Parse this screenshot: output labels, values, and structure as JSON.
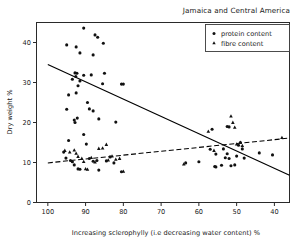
{
  "chart_data": {
    "type": "scatter",
    "title": "Jamaica and Central America",
    "xlabel": "Increasing sclerophylly (i.e decreasing water content) %",
    "ylabel": "Dry weight  %",
    "xlim": [
      103,
      36
    ],
    "ylim": [
      0,
      45
    ],
    "x_ticks": [
      100,
      90,
      80,
      70,
      60,
      50,
      40
    ],
    "y_ticks": [
      0,
      10,
      20,
      30,
      40
    ],
    "x_axis_direction": "decreasing",
    "grid": false,
    "legend_position": "top-right",
    "legend": [
      {
        "name": "protein content",
        "marker": "dot"
      },
      {
        "name": "fibre content",
        "marker": "triangle"
      }
    ],
    "series": [
      {
        "name": "protein content",
        "marker": "dot",
        "trendline": {
          "style": "solid",
          "x1": 100,
          "y1": 34.5,
          "x2": 36,
          "y2": 6.8
        },
        "points": [
          [
            95,
            39.4
          ],
          [
            92.5,
            38.9
          ],
          [
            91.5,
            37.4
          ],
          [
            90.5,
            43.6
          ],
          [
            87.5,
            41.9
          ],
          [
            86.8,
            41.3
          ],
          [
            85.3,
            39.8
          ],
          [
            88.0,
            36.9
          ],
          [
            94.5,
            26.9
          ],
          [
            95.0,
            23.3
          ],
          [
            92.8,
            32.4
          ],
          [
            92.3,
            32.3
          ],
          [
            92.6,
            31.5
          ],
          [
            93.5,
            30.8
          ],
          [
            91.5,
            30.4
          ],
          [
            92.0,
            29.2
          ],
          [
            92.5,
            27.4
          ],
          [
            90.5,
            31.8
          ],
          [
            88.5,
            31.9
          ],
          [
            85.0,
            32.3
          ],
          [
            85.5,
            29.7
          ],
          [
            80.5,
            29.6
          ],
          [
            80.0,
            29.6
          ],
          [
            93.0,
            20.6
          ],
          [
            92.8,
            20.0
          ],
          [
            92.2,
            21.1
          ],
          [
            89.5,
            25.0
          ],
          [
            89.0,
            23.4
          ],
          [
            88.0,
            22.9
          ],
          [
            86.5,
            20.9
          ],
          [
            82.0,
            20.1
          ],
          [
            94.5,
            15.5
          ],
          [
            90.5,
            17.0
          ],
          [
            89.8,
            14.6
          ],
          [
            95.8,
            12.6
          ],
          [
            95.2,
            11.1
          ],
          [
            94.0,
            10.5
          ],
          [
            93.5,
            10.2
          ],
          [
            93.0,
            9.4
          ],
          [
            92.0,
            8.4
          ],
          [
            91.5,
            8.3
          ],
          [
            89.0,
            11.0
          ],
          [
            88.0,
            10.3
          ],
          [
            87.0,
            10.5
          ],
          [
            86.5,
            8.1
          ],
          [
            84.5,
            10.4
          ],
          [
            83.5,
            11.4
          ],
          [
            82.5,
            9.9
          ],
          [
            80.5,
            7.7
          ],
          [
            63.5,
            9.9
          ],
          [
            60.0,
            10.2
          ],
          [
            56.5,
            18.3
          ],
          [
            57.0,
            13.3
          ],
          [
            55.5,
            12.1
          ],
          [
            55.8,
            9.0
          ],
          [
            55.5,
            8.9
          ],
          [
            54.0,
            9.3
          ],
          [
            53.0,
            11.2
          ],
          [
            52.5,
            19.0
          ],
          [
            52.0,
            18.9
          ],
          [
            53.5,
            13.4
          ],
          [
            52.5,
            12.2
          ],
          [
            52.0,
            11.0
          ],
          [
            51.5,
            9.2
          ],
          [
            50.5,
            9.4
          ],
          [
            50.0,
            11.6
          ],
          [
            49.5,
            14.3
          ],
          [
            49.0,
            15.0
          ],
          [
            48.5,
            13.4
          ],
          [
            48.0,
            11.1
          ],
          [
            44.0,
            12.4
          ],
          [
            40.5,
            11.9
          ]
        ]
      },
      {
        "name": "fibre content",
        "marker": "triangle",
        "trendline": {
          "style": "dashed",
          "x1": 100,
          "y1": 9.9,
          "x2": 36,
          "y2": 16.1
        },
        "points": [
          [
            95.5,
            13.0
          ],
          [
            94.2,
            12.6
          ],
          [
            93.0,
            13.1
          ],
          [
            92.5,
            12.3
          ],
          [
            92.0,
            11.5
          ],
          [
            91.0,
            11.0
          ],
          [
            90.5,
            10.2
          ],
          [
            90.0,
            8.4
          ],
          [
            89.5,
            8.3
          ],
          [
            88.5,
            11.2
          ],
          [
            87.5,
            10.1
          ],
          [
            86.5,
            13.5
          ],
          [
            85.5,
            13.6
          ],
          [
            84.5,
            14.5
          ],
          [
            84.0,
            10.6
          ],
          [
            83.0,
            11.6
          ],
          [
            82.0,
            10.8
          ],
          [
            81.0,
            11.0
          ],
          [
            80.0,
            7.8
          ],
          [
            64.0,
            9.6
          ],
          [
            57.5,
            17.8
          ],
          [
            56.0,
            13.0
          ],
          [
            51.5,
            21.6
          ],
          [
            51.0,
            20.0
          ],
          [
            50.5,
            18.8
          ],
          [
            50.0,
            14.6
          ],
          [
            49.0,
            15.0
          ],
          [
            48.5,
            14.2
          ],
          [
            38.0,
            16.2
          ]
        ]
      }
    ]
  },
  "labels": {
    "x_tick_texts": [
      "100",
      "90",
      "80",
      "70",
      "60",
      "50",
      "40"
    ],
    "y_tick_texts": [
      "0",
      "10",
      "20",
      "30",
      "40"
    ]
  }
}
